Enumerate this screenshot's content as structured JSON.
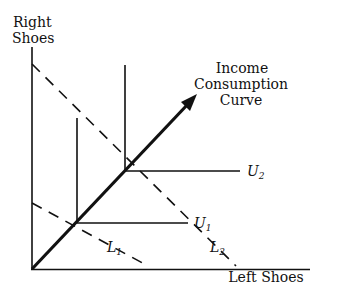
{
  "diagram": {
    "type": "economics-indifference-curve",
    "y_axis_label_line1": "Right",
    "y_axis_label_line2": "Shoes",
    "x_axis_label": "Left Shoes",
    "curve_label_line1": "Income",
    "curve_label_line2": "Consumption",
    "curve_label_line3": "Curve",
    "budget_lines": [
      {
        "name": "L",
        "sub": "1"
      },
      {
        "name": "L",
        "sub": "2"
      }
    ],
    "indifference_curves": [
      {
        "name": "U",
        "sub": "1"
      },
      {
        "name": "U",
        "sub": "2"
      }
    ],
    "colors": {
      "line": "#111111",
      "background": "#ffffff"
    }
  }
}
